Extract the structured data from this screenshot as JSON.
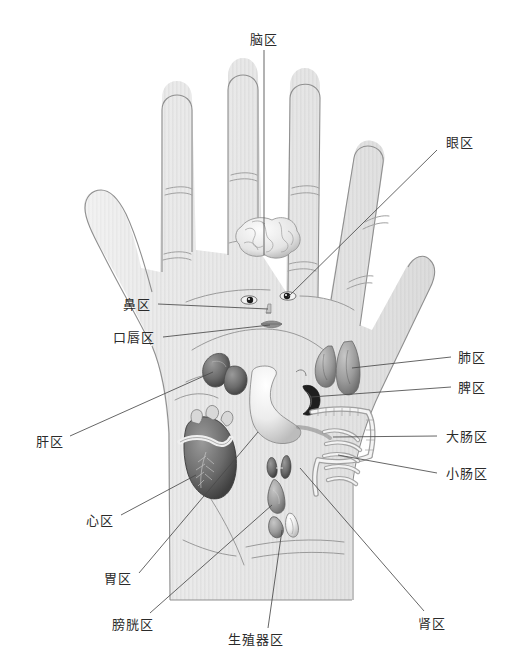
{
  "figure": {
    "background_color": "#ffffff",
    "hand_fill_color": "#e6e6e6",
    "hand_outline_color": "#8c8c8c",
    "leader_line_color": "#4a4a4a",
    "label_text_color": "#2b2b2b",
    "width": 515,
    "height": 672
  },
  "labels": [
    {
      "id": "brain",
      "text": "脑区",
      "meaning": "Brain zone",
      "x": 264,
      "y": 39,
      "align": "anchor-mid",
      "leader": [
        [
          264,
          50
        ],
        [
          264,
          255
        ]
      ],
      "organ_point": [
        264,
        240
      ]
    },
    {
      "id": "eye",
      "text": "眼区",
      "meaning": "Eye zone",
      "x": 460,
      "y": 142,
      "align": "anchor-mid",
      "leader": [
        [
          437,
          150
        ],
        [
          288,
          297
        ]
      ],
      "organ_point": [
        288,
        297
      ]
    },
    {
      "id": "nose",
      "text": "鼻区",
      "meaning": "Nose zone",
      "x": 137,
      "y": 304,
      "align": "anchor-mid",
      "leader": [
        [
          158,
          304
        ],
        [
          268,
          309
        ]
      ],
      "organ_point": [
        268,
        309
      ]
    },
    {
      "id": "mouth-lips",
      "text": "口唇区",
      "meaning": "Mouth and lips zone",
      "x": 134,
      "y": 337,
      "align": "anchor-mid",
      "leader": [
        [
          163,
          337
        ],
        [
          270,
          325
        ]
      ],
      "organ_point": [
        270,
        325
      ]
    },
    {
      "id": "lung",
      "text": "肺区",
      "meaning": "Lung zone",
      "x": 472,
      "y": 357,
      "align": "anchor-mid",
      "leader": [
        [
          451,
          357
        ],
        [
          352,
          368
        ]
      ],
      "organ_point": [
        352,
        368
      ]
    },
    {
      "id": "spleen",
      "text": "脾区",
      "meaning": "Spleen zone",
      "x": 472,
      "y": 387,
      "align": "anchor-mid",
      "leader": [
        [
          451,
          387
        ],
        [
          311,
          397
        ]
      ],
      "organ_point": [
        311,
        397
      ]
    },
    {
      "id": "large-intestine",
      "text": "大肠区",
      "meaning": "Large intestine zone",
      "x": 467,
      "y": 436,
      "align": "anchor-mid",
      "leader": [
        [
          437,
          436
        ],
        [
          333,
          437
        ]
      ],
      "organ_point": [
        333,
        437
      ]
    },
    {
      "id": "small-intestine",
      "text": "小肠区",
      "meaning": "Small intestine zone",
      "x": 467,
      "y": 473,
      "align": "anchor-mid",
      "leader": [
        [
          437,
          473
        ],
        [
          338,
          455
        ]
      ],
      "organ_point": [
        338,
        455
      ]
    },
    {
      "id": "liver",
      "text": "肝区",
      "meaning": "Liver zone",
      "x": 50,
      "y": 441,
      "align": "anchor-mid",
      "leader": [
        [
          70,
          436
        ],
        [
          213,
          372
        ]
      ],
      "organ_point": [
        213,
        372
      ]
    },
    {
      "id": "heart",
      "text": "心区",
      "meaning": "Heart zone",
      "x": 100,
      "y": 520,
      "align": "anchor-mid",
      "leader": [
        [
          121,
          515
        ],
        [
          196,
          475
        ]
      ],
      "organ_point": [
        196,
        475
      ]
    },
    {
      "id": "stomach",
      "text": "胃区",
      "meaning": "Stomach zone",
      "x": 118,
      "y": 578,
      "align": "anchor-mid",
      "leader": [
        [
          139,
          573
        ],
        [
          258,
          432
        ]
      ],
      "organ_point": [
        258,
        432
      ]
    },
    {
      "id": "bladder",
      "text": "膀胱区",
      "meaning": "Bladder zone",
      "x": 133,
      "y": 624,
      "align": "anchor-mid",
      "leader": [
        [
          150,
          613
        ],
        [
          272,
          505
        ]
      ],
      "organ_point": [
        272,
        505
      ]
    },
    {
      "id": "reproductive",
      "text": "生殖器区",
      "meaning": "Reproductive organ zone",
      "x": 256,
      "y": 639,
      "align": "anchor-mid",
      "leader": [
        [
          268,
          628
        ],
        [
          282,
          530
        ]
      ],
      "organ_point": [
        282,
        530
      ]
    },
    {
      "id": "kidney",
      "text": "肾区",
      "meaning": "Kidney zone",
      "x": 432,
      "y": 623,
      "align": "anchor-mid",
      "leader": [
        [
          424,
          611
        ],
        [
          300,
          468
        ]
      ],
      "organ_point": [
        300,
        468
      ]
    }
  ],
  "organs": [
    {
      "id": "brain-organ",
      "name": "brain",
      "cx": 264,
      "cy": 237
    },
    {
      "id": "eye-left-organ",
      "name": "eye-left",
      "cx": 249,
      "cy": 300
    },
    {
      "id": "eye-right-organ",
      "name": "eye-right",
      "cx": 288,
      "cy": 296
    },
    {
      "id": "nose-organ",
      "name": "nose",
      "cx": 269,
      "cy": 310
    },
    {
      "id": "mouth-organ",
      "name": "mouth",
      "cx": 271,
      "cy": 325
    },
    {
      "id": "lung-organ",
      "name": "lungs",
      "cx": 340,
      "cy": 366
    },
    {
      "id": "liver-organ",
      "name": "liver",
      "cx": 218,
      "cy": 376
    },
    {
      "id": "stomach-organ",
      "name": "stomach",
      "cx": 262,
      "cy": 406
    },
    {
      "id": "spleen-organ",
      "name": "spleen",
      "cx": 308,
      "cy": 398
    },
    {
      "id": "large-intestine-organ",
      "name": "large-intestine",
      "cx": 330,
      "cy": 430
    },
    {
      "id": "small-intestine-organ",
      "name": "small-intestine",
      "cx": 333,
      "cy": 462
    },
    {
      "id": "heart-organ",
      "name": "heart",
      "cx": 200,
      "cy": 470
    },
    {
      "id": "kidney-organ",
      "name": "kidneys",
      "cx": 280,
      "cy": 466
    },
    {
      "id": "bladder-organ",
      "name": "bladder",
      "cx": 273,
      "cy": 500
    },
    {
      "id": "reproductive-organ",
      "name": "reproductive",
      "cx": 284,
      "cy": 528
    }
  ]
}
